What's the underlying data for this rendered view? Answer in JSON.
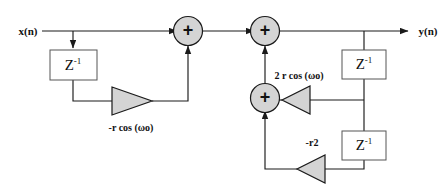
{
  "diagram": {
    "colors": {
      "line": "#1a1a1a",
      "shape_fill": "#d4d4d4",
      "shape_stroke": "#1a1a1a",
      "box_fill": "#ffffff",
      "text": "#111111",
      "background": "#ffffff"
    },
    "io": {
      "input_label": "x(n)",
      "output_label": "y(n)"
    },
    "delays": [
      {
        "id": "delay-input",
        "label": "Z",
        "exponent": "-1"
      },
      {
        "id": "delay-feedback-1",
        "label": "Z",
        "exponent": "-1"
      },
      {
        "id": "delay-feedback-2",
        "label": "Z",
        "exponent": "-1"
      }
    ],
    "adders": [
      {
        "id": "adder-feedforward",
        "symbol": "+"
      },
      {
        "id": "adder-output",
        "symbol": "+"
      },
      {
        "id": "adder-feedback",
        "symbol": "+"
      }
    ],
    "gains": [
      {
        "id": "gain-feedforward",
        "label": "-r cos (ωo)",
        "direction": "right"
      },
      {
        "id": "gain-feedback-1",
        "label": "2 r cos (ωo)",
        "direction": "left"
      },
      {
        "id": "gain-feedback-2",
        "label": "-r2",
        "direction": "left"
      }
    ]
  }
}
